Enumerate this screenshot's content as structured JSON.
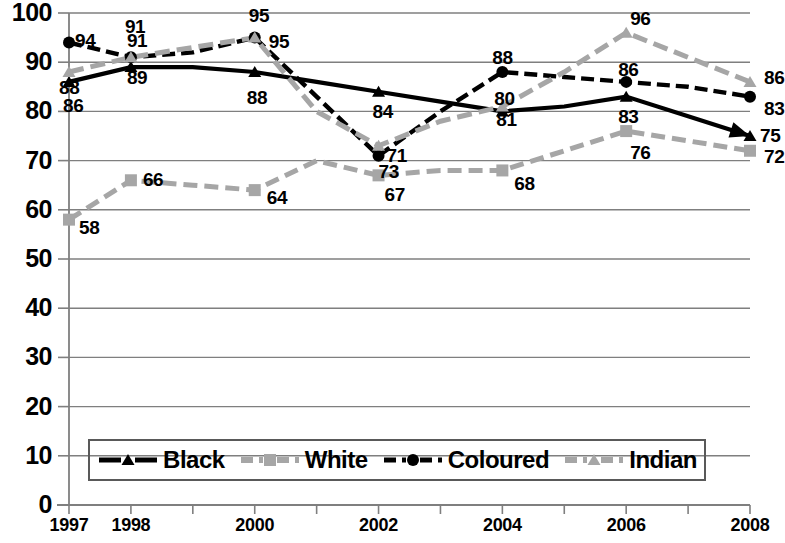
{
  "chart_data": {
    "type": "line",
    "title": "",
    "subtitle": "",
    "xlabel": "",
    "ylabel": "",
    "ylim": [
      0,
      100
    ],
    "ytick_step": 10,
    "grid": true,
    "legend_position": "bottom",
    "x": [
      1997,
      1998,
      1999,
      2000,
      2001,
      2002,
      2003,
      2004,
      2005,
      2006,
      2007,
      2008
    ],
    "categories": [
      "1997",
      "1998",
      "1999",
      "2000",
      "2001",
      "2002",
      "2003",
      "2004",
      "2005",
      "2006",
      "2007",
      "2008"
    ],
    "xtick_labels": [
      "1997",
      "1998",
      "",
      "2000",
      "",
      "2002",
      "",
      "2004",
      "",
      "2006",
      "",
      "2008"
    ],
    "ytick_labels": [
      "0",
      "10",
      "20",
      "30",
      "40",
      "50",
      "60",
      "70",
      "80",
      "90",
      "100"
    ],
    "series": [
      {
        "name": "Black",
        "color": "#000000",
        "line": "solid",
        "marker": "triangle",
        "values": [
          86,
          89,
          89,
          88,
          86,
          84,
          82,
          80,
          81,
          83,
          79,
          75
        ],
        "labels": [
          {
            "x": 1997,
            "y": 86,
            "text": "86"
          },
          {
            "x": 1998,
            "y": 89,
            "text": "89"
          },
          {
            "x": 2000,
            "y": 88,
            "text": "88"
          },
          {
            "x": 2002,
            "y": 84,
            "text": "84"
          },
          {
            "x": 2004,
            "y": 80,
            "text": "80"
          },
          {
            "x": 2006,
            "y": 83,
            "text": "83"
          },
          {
            "x": 2008,
            "y": 75,
            "text": "75"
          }
        ]
      },
      {
        "name": "White",
        "color": "#a6a6a6",
        "line": "dashed",
        "marker": "square",
        "values": [
          58,
          66,
          65,
          64,
          70,
          67,
          68,
          68,
          72,
          76,
          74,
          72
        ],
        "labels": [
          {
            "x": 1997,
            "y": 58,
            "text": "58"
          },
          {
            "x": 1998,
            "y": 66,
            "text": "66"
          },
          {
            "x": 2000,
            "y": 64,
            "text": "64"
          },
          {
            "x": 2002,
            "y": 67,
            "text": "67"
          },
          {
            "x": 2004,
            "y": 68,
            "text": "68"
          },
          {
            "x": 2006,
            "y": 76,
            "text": "76"
          },
          {
            "x": 2008,
            "y": 72,
            "text": "72"
          }
        ]
      },
      {
        "name": "Coloured",
        "color": "#000000",
        "line": "dashed",
        "marker": "circle",
        "values": [
          94,
          91,
          92,
          95,
          83,
          71,
          80,
          88,
          87,
          86,
          85,
          83
        ],
        "labels": [
          {
            "x": 1997,
            "y": 94,
            "text": "94"
          },
          {
            "x": 1998,
            "y": 91,
            "text": "91"
          },
          {
            "x": 2000,
            "y": 95,
            "text": "95"
          },
          {
            "x": 2002,
            "y": 71,
            "text": "71"
          },
          {
            "x": 2004,
            "y": 88,
            "text": "88"
          },
          {
            "x": 2006,
            "y": 86,
            "text": "86"
          },
          {
            "x": 2008,
            "y": 83,
            "text": "83"
          }
        ]
      },
      {
        "name": "Indian",
        "color": "#a6a6a6",
        "line": "dashed",
        "marker": "triangle",
        "values": [
          88,
          91,
          93,
          95,
          80,
          73,
          78,
          81,
          88,
          96,
          91,
          86
        ],
        "labels": [
          {
            "x": 1997,
            "y": 88,
            "text": "88"
          },
          {
            "x": 1998,
            "y": 91,
            "text": "91"
          },
          {
            "x": 2000,
            "y": 95,
            "text": "95"
          },
          {
            "x": 2002,
            "y": 73,
            "text": "73"
          },
          {
            "x": 2004,
            "y": 81,
            "text": "81"
          },
          {
            "x": 2006,
            "y": 96,
            "text": "96"
          },
          {
            "x": 2008,
            "y": 86,
            "text": "86"
          }
        ]
      }
    ]
  },
  "legend": {
    "items": [
      {
        "label": "Black"
      },
      {
        "label": "White"
      },
      {
        "label": "Coloured"
      },
      {
        "label": "Indian"
      }
    ]
  },
  "axis_colors": {
    "grid": "#7f7f7f",
    "axis": "#7f7f7f",
    "black_series": "#000000",
    "gray_series": "#a6a6a6"
  }
}
